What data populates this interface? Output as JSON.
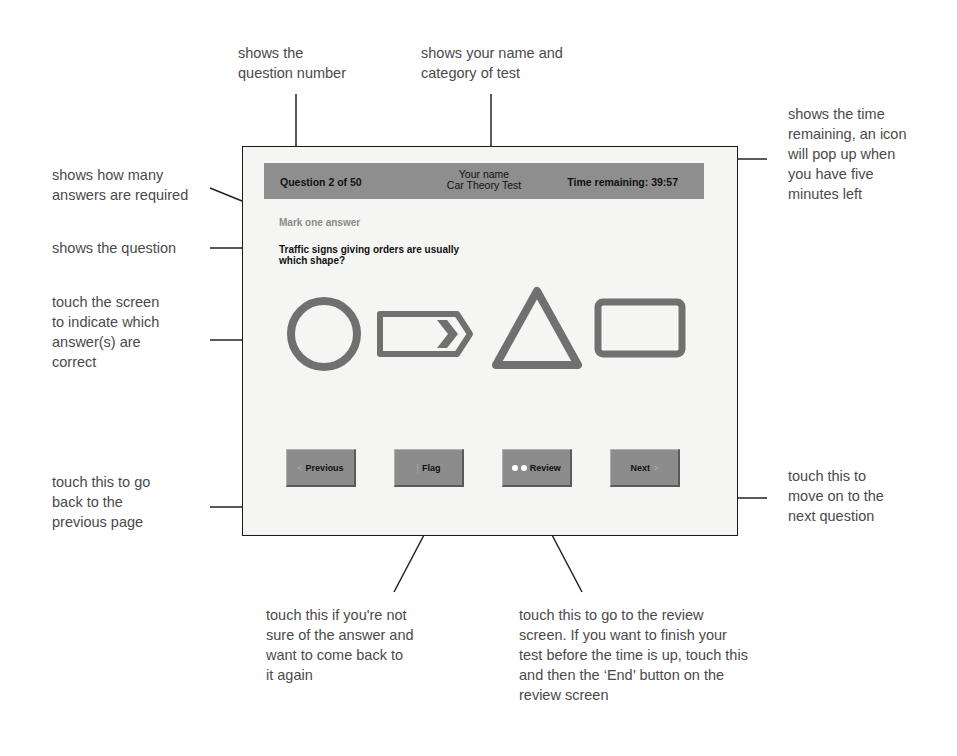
{
  "screen": {
    "header": {
      "question_counter": "Question 2 of 50",
      "candidate_name": "Your name",
      "test_category": "Car Theory Test",
      "time_remaining": "Time remaining: 39:57"
    },
    "instruction": "Mark one answer",
    "question": "Traffic signs giving orders are usually which shape?",
    "answers": [
      {
        "shape": "circle"
      },
      {
        "shape": "rectangle-with-chevron"
      },
      {
        "shape": "triangle"
      },
      {
        "shape": "rectangle"
      }
    ],
    "buttons": {
      "previous": {
        "label": "Previous",
        "icon": "arrow-left-icon"
      },
      "flag": {
        "label": "Flag",
        "icon": "flag-icon"
      },
      "review": {
        "label": "Review",
        "icon": "dots-icon"
      },
      "next": {
        "label": "Next",
        "icon": "arrow-right-icon"
      }
    },
    "colors": {
      "header_bg": "#8e8e8e",
      "button_bg": "#8c8c8c",
      "shape_stroke": "#707070",
      "screen_bg": "#f5f5f3"
    }
  },
  "callouts": {
    "question_number": "shows the\nquestion number",
    "name_category": "shows your name and\ncategory of test",
    "time_remaining": "shows the time\nremaining, an icon\nwill pop up when\nyou have five\nminutes left",
    "answers_required": "shows how many\nanswers are required",
    "shows_question": "shows the question",
    "touch_screen": "touch the screen\nto indicate which\nanswer(s) are\ncorrect",
    "previous": "touch this to go\nback to the\nprevious page",
    "next": "touch this to\nmove on to the\nnext question",
    "flag": "touch this if you're not\nsure of the answer and\nwant to come back to\nit again",
    "review": "touch this to go to the review\nscreen. If you want to finish your\ntest before the time is up, touch this\nand then the ‘End’ button on the\nreview screen"
  }
}
